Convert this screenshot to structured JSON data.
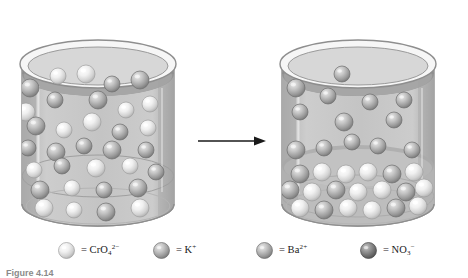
{
  "figure": {
    "caption": "Figure 4.14",
    "arrow_icon": "right-arrow-icon",
    "reaction_description": "Precipitation reaction of potassium chromate with barium nitrate forming barium chromate precipitate"
  },
  "colors": {
    "background": "#ffffff",
    "glass_outline": "#7a7a7a",
    "glass_body": "#e9e9e9",
    "solution_light": "#c9c9c9",
    "solution_shadow": "#a8a8a8",
    "solution_surface": "#9a9a9a",
    "precipitate_band": "#bdbdbd",
    "sphere_pale": "#f2f2f2",
    "sphere_medium": "#b0b0b0",
    "sphere_dark": "#7e7e7e",
    "arrow": "#1a1a1a",
    "caption_text": "#8a8a8a"
  },
  "beakers": [
    {
      "name": "left-beaker",
      "label": "reactant-beaker",
      "contents": "mixed CrO4 2- and K+ ions dispersed in solution"
    },
    {
      "name": "right-beaker",
      "label": "product-beaker",
      "contents": "K+ and NO3- ions in solution above settled pale BaCrO4 precipitate"
    }
  ],
  "legend": {
    "items": [
      {
        "icon": "pale-sphere-icon",
        "sphere_style": "pale",
        "equals": "=",
        "formula_main": "CrO",
        "formula_sub": "4",
        "formula_sup": "2−",
        "plain": "= CrO4 2−",
        "x": 58
      },
      {
        "icon": "medium-sphere-icon",
        "sphere_style": "medium",
        "equals": "=",
        "formula_main": "K",
        "formula_sub": "",
        "formula_sup": "+",
        "plain": "= K+",
        "x": 153
      },
      {
        "icon": "medium-sphere-icon",
        "sphere_style": "medium",
        "equals": "=",
        "formula_main": "Ba",
        "formula_sub": "",
        "formula_sup": "2+",
        "plain": "= Ba2+",
        "x": 256
      },
      {
        "icon": "dark-sphere-icon",
        "sphere_style": "dark",
        "equals": "=",
        "formula_main": "NO",
        "formula_sub": "3",
        "formula_sup": "−",
        "plain": "= NO3−",
        "x": 360
      }
    ]
  },
  "chart_data": {
    "type": "diagram",
    "title": "Figure 4.14",
    "left_beaker_spheres": [
      {
        "x": 30,
        "y": 88,
        "r": 9,
        "style": "medium"
      },
      {
        "x": 58,
        "y": 76,
        "r": 8,
        "style": "pale"
      },
      {
        "x": 86,
        "y": 74,
        "r": 9,
        "style": "pale"
      },
      {
        "x": 112,
        "y": 84,
        "r": 8,
        "style": "medium"
      },
      {
        "x": 140,
        "y": 80,
        "r": 9,
        "style": "medium"
      },
      {
        "x": 26,
        "y": 112,
        "r": 9,
        "style": "pale"
      },
      {
        "x": 55,
        "y": 100,
        "r": 8,
        "style": "medium"
      },
      {
        "x": 98,
        "y": 100,
        "r": 9,
        "style": "medium"
      },
      {
        "x": 126,
        "y": 110,
        "r": 8,
        "style": "pale"
      },
      {
        "x": 150,
        "y": 104,
        "r": 8,
        "style": "pale"
      },
      {
        "x": 36,
        "y": 126,
        "r": 9,
        "style": "medium"
      },
      {
        "x": 64,
        "y": 130,
        "r": 8,
        "style": "pale"
      },
      {
        "x": 92,
        "y": 122,
        "r": 9,
        "style": "pale"
      },
      {
        "x": 120,
        "y": 132,
        "r": 8,
        "style": "medium"
      },
      {
        "x": 148,
        "y": 128,
        "r": 8,
        "style": "pale"
      },
      {
        "x": 28,
        "y": 148,
        "r": 8,
        "style": "medium"
      },
      {
        "x": 56,
        "y": 152,
        "r": 9,
        "style": "medium"
      },
      {
        "x": 84,
        "y": 146,
        "r": 8,
        "style": "medium"
      },
      {
        "x": 112,
        "y": 150,
        "r": 9,
        "style": "medium"
      },
      {
        "x": 146,
        "y": 150,
        "r": 8,
        "style": "medium"
      },
      {
        "x": 34,
        "y": 170,
        "r": 8,
        "style": "pale"
      },
      {
        "x": 62,
        "y": 166,
        "r": 8,
        "style": "medium"
      },
      {
        "x": 96,
        "y": 168,
        "r": 9,
        "style": "pale"
      },
      {
        "x": 130,
        "y": 166,
        "r": 8,
        "style": "pale"
      },
      {
        "x": 156,
        "y": 172,
        "r": 8,
        "style": "medium"
      },
      {
        "x": 40,
        "y": 190,
        "r": 9,
        "style": "medium"
      },
      {
        "x": 72,
        "y": 188,
        "r": 8,
        "style": "pale"
      },
      {
        "x": 104,
        "y": 190,
        "r": 8,
        "style": "medium"
      },
      {
        "x": 138,
        "y": 188,
        "r": 9,
        "style": "medium"
      },
      {
        "x": 44,
        "y": 208,
        "r": 9,
        "style": "pale"
      },
      {
        "x": 74,
        "y": 210,
        "r": 8,
        "style": "pale"
      },
      {
        "x": 106,
        "y": 212,
        "r": 9,
        "style": "medium"
      },
      {
        "x": 140,
        "y": 208,
        "r": 9,
        "style": "pale"
      }
    ],
    "right_beaker_solution_spheres": [
      {
        "x": 342,
        "y": 74,
        "r": 8,
        "style": "medium"
      },
      {
        "x": 296,
        "y": 88,
        "r": 9,
        "style": "medium"
      },
      {
        "x": 328,
        "y": 96,
        "r": 8,
        "style": "medium"
      },
      {
        "x": 370,
        "y": 102,
        "r": 8,
        "style": "medium"
      },
      {
        "x": 404,
        "y": 100,
        "r": 8,
        "style": "medium"
      },
      {
        "x": 300,
        "y": 112,
        "r": 8,
        "style": "medium"
      },
      {
        "x": 344,
        "y": 122,
        "r": 9,
        "style": "medium"
      },
      {
        "x": 394,
        "y": 120,
        "r": 8,
        "style": "medium"
      },
      {
        "x": 352,
        "y": 142,
        "r": 8,
        "style": "medium"
      },
      {
        "x": 296,
        "y": 150,
        "r": 9,
        "style": "medium"
      },
      {
        "x": 324,
        "y": 148,
        "r": 8,
        "style": "medium"
      },
      {
        "x": 378,
        "y": 146,
        "r": 8,
        "style": "medium"
      },
      {
        "x": 412,
        "y": 150,
        "r": 8,
        "style": "medium"
      }
    ],
    "right_beaker_precipitate_spheres": [
      {
        "x": 300,
        "y": 174,
        "r": 9,
        "style": "medium"
      },
      {
        "x": 322,
        "y": 172,
        "r": 9,
        "style": "pale"
      },
      {
        "x": 346,
        "y": 174,
        "r": 9,
        "style": "pale"
      },
      {
        "x": 368,
        "y": 172,
        "r": 9,
        "style": "pale"
      },
      {
        "x": 392,
        "y": 174,
        "r": 9,
        "style": "medium"
      },
      {
        "x": 414,
        "y": 172,
        "r": 9,
        "style": "pale"
      },
      {
        "x": 290,
        "y": 190,
        "r": 9,
        "style": "medium"
      },
      {
        "x": 312,
        "y": 192,
        "r": 9,
        "style": "pale"
      },
      {
        "x": 336,
        "y": 190,
        "r": 9,
        "style": "medium"
      },
      {
        "x": 358,
        "y": 192,
        "r": 9,
        "style": "pale"
      },
      {
        "x": 382,
        "y": 190,
        "r": 9,
        "style": "pale"
      },
      {
        "x": 406,
        "y": 192,
        "r": 9,
        "style": "medium"
      },
      {
        "x": 424,
        "y": 188,
        "r": 9,
        "style": "pale"
      },
      {
        "x": 300,
        "y": 208,
        "r": 9,
        "style": "pale"
      },
      {
        "x": 324,
        "y": 210,
        "r": 9,
        "style": "medium"
      },
      {
        "x": 348,
        "y": 208,
        "r": 9,
        "style": "pale"
      },
      {
        "x": 372,
        "y": 210,
        "r": 9,
        "style": "pale"
      },
      {
        "x": 396,
        "y": 208,
        "r": 9,
        "style": "medium"
      },
      {
        "x": 418,
        "y": 206,
        "r": 9,
        "style": "pale"
      }
    ]
  }
}
